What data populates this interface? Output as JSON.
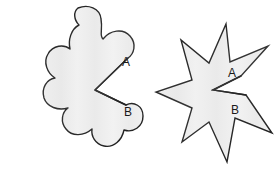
{
  "figure": {
    "background_color": "#ffffff",
    "width": 277,
    "height": 175,
    "style": {
      "fill_color": "#ececec",
      "fill_highlight_color": "#f4f4f4",
      "outline_color": "#2b2b2b",
      "outline_width": 1.4,
      "label_color": "#1a1a1a",
      "label_font_size": 12
    },
    "shapes": [
      {
        "id": "flower-shape",
        "name": "scalloped-flower-shape",
        "side": "left",
        "lobe_count": 9,
        "outline_style": "rounded-scalloped",
        "center": {
          "x": 75,
          "y": 88
        },
        "labels": [
          {
            "id": "flower-label-a",
            "text": "A",
            "x": 126,
            "y": 63
          },
          {
            "id": "flower-label-b",
            "text": "B",
            "x": 128,
            "y": 113
          }
        ]
      },
      {
        "id": "star-shape",
        "name": "seven-point-star-shape",
        "side": "right",
        "point_count": 7,
        "outline_style": "straight-pointed",
        "center": {
          "x": 215,
          "y": 90
        },
        "labels": [
          {
            "id": "star-label-a",
            "text": "A",
            "x": 232,
            "y": 74
          },
          {
            "id": "star-label-b",
            "text": "B",
            "x": 235,
            "y": 111
          }
        ]
      }
    ]
  }
}
